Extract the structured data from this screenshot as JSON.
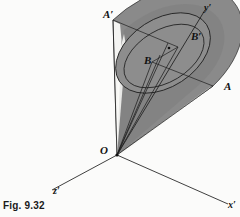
{
  "figure": {
    "caption": "Fig. 9.32",
    "background_color": "#fbfbfa",
    "ink_color": "#1a1a1a",
    "cone_fill_color": "#8a8a8a",
    "cone_dark_color": "#6f6f6f",
    "cone_highlight_color": "#f4f4f2",
    "ellipse_fill_color": "#8d8d8d"
  },
  "labels": {
    "origin": "O",
    "apex_point": "A′",
    "right_point": "A",
    "inner_point": "B",
    "outer_point": "B′"
  },
  "axes": {
    "x": "x′",
    "y": "y′",
    "z": "z′"
  },
  "geometry": {
    "origin_px": [
      117,
      155
    ],
    "apex_ellipse_left_px": [
      113,
      20
    ],
    "apex_ellipse_right_px": [
      213,
      86
    ],
    "y_axis_end_px": [
      205,
      10
    ],
    "x_axis_end_px": [
      228,
      204
    ],
    "z_axis_end_px": [
      52,
      190
    ],
    "b_prime_px": [
      178,
      47
    ],
    "b_px": [
      152,
      62
    ]
  }
}
